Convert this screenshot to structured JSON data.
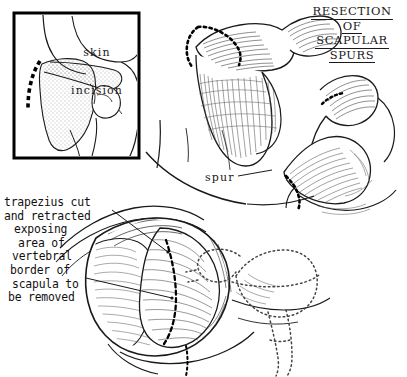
{
  "figure": {
    "kind": "medical-surgical-illustration",
    "style": "pen-and-ink line drawing",
    "background_color": "#ffffff",
    "ink_color": "#111111",
    "width": 407,
    "height": 377
  },
  "title": {
    "lines": [
      "RESECTION",
      "OF",
      "SCAPULAR",
      "SPURS"
    ],
    "underlined": true,
    "position": "top-right"
  },
  "inset": {
    "label_lines": [
      "skin",
      "incision"
    ],
    "border_color": "#000000",
    "description": "posterior shoulder with stippled scapula and dashed skin incision along medial border"
  },
  "labels": {
    "spur": "spur"
  },
  "caption": {
    "lines": [
      "trapezius cut",
      "and retracted",
      "exposing",
      "area of",
      "vertebral",
      "border of",
      "scapula to",
      "be removed"
    ],
    "position": "lower-left"
  },
  "panels": [
    {
      "name": "inset-skin-incision",
      "label": "skin incision",
      "features": [
        "stippled scapula",
        "dashed incision line",
        "torso outline"
      ]
    },
    {
      "name": "scapular-spur-superior-view",
      "label": "",
      "features": [
        "hatched bone",
        "dotted resection line"
      ]
    },
    {
      "name": "scapular-spur-lateral-view",
      "label": "spur",
      "features": [
        "hatched bone",
        "spur prominence",
        "dotted resection line"
      ]
    },
    {
      "name": "surgical-field-exposure",
      "label": "trapezius cut and retracted",
      "features": [
        "open wound",
        "retracted muscle",
        "dashed resection line",
        "ghost scapula outline"
      ]
    }
  ]
}
